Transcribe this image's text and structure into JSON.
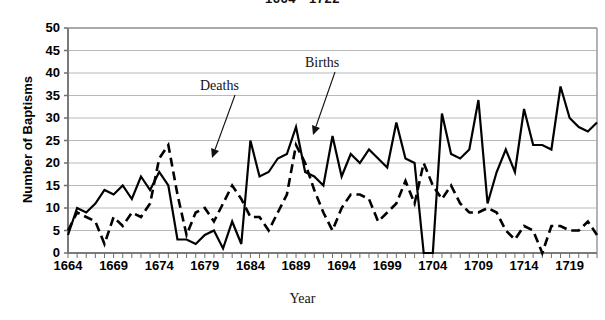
{
  "chart_data": {
    "type": "line",
    "title": "1664 - 1722",
    "xlabel": "Year",
    "ylabel": "Number of Baptisms",
    "xlim": [
      1664,
      1722
    ],
    "ylim": [
      0,
      50
    ],
    "ytick_step": 5,
    "xtick_step": 5,
    "grid": "horizontal",
    "legend_position": "inline-annotations",
    "x": [
      1664,
      1665,
      1666,
      1667,
      1668,
      1669,
      1670,
      1671,
      1672,
      1673,
      1674,
      1675,
      1676,
      1677,
      1678,
      1679,
      1680,
      1681,
      1682,
      1683,
      1684,
      1685,
      1686,
      1687,
      1688,
      1689,
      1690,
      1691,
      1692,
      1693,
      1694,
      1695,
      1696,
      1697,
      1698,
      1699,
      1700,
      1701,
      1702,
      1703,
      1704,
      1705,
      1706,
      1707,
      1708,
      1709,
      1710,
      1711,
      1712,
      1713,
      1714,
      1715,
      1716,
      1717,
      1718,
      1719,
      1720,
      1721,
      1722
    ],
    "xticks": [
      1664,
      1669,
      1674,
      1679,
      1684,
      1689,
      1694,
      1699,
      1704,
      1709,
      1714,
      1719
    ],
    "yticks": [
      0,
      5,
      10,
      15,
      20,
      25,
      30,
      35,
      40,
      45,
      50
    ],
    "series": [
      {
        "name": "Births",
        "style": "solid",
        "color": "#000000",
        "values": [
          4,
          10,
          9,
          11,
          14,
          13,
          15,
          12,
          17,
          14,
          18,
          15,
          3,
          3,
          2,
          4,
          5,
          1,
          7,
          2,
          25,
          17,
          18,
          21,
          22,
          28,
          18,
          17,
          15,
          26,
          17,
          22,
          20,
          23,
          21,
          19,
          29,
          21,
          20,
          0,
          0,
          31,
          22,
          21,
          23,
          34,
          11,
          18,
          23,
          18,
          32,
          24,
          24,
          23,
          37,
          30,
          28,
          27,
          29
        ]
      },
      {
        "name": "Deaths",
        "style": "dashed",
        "color": "#000000",
        "values": [
          5,
          9,
          8,
          7,
          2,
          8,
          6,
          9,
          8,
          11,
          21,
          24,
          13,
          4,
          9,
          10,
          7,
          11,
          15,
          12,
          8,
          8,
          5,
          9,
          13,
          24,
          20,
          14,
          9,
          5,
          10,
          13,
          13,
          12,
          7,
          9,
          11,
          16,
          11,
          20,
          15,
          12,
          15,
          11,
          9,
          9,
          10,
          9,
          5,
          3,
          6,
          5,
          0,
          6,
          6,
          5,
          5,
          7,
          4
        ]
      }
    ],
    "annotations": [
      {
        "text": "Deaths",
        "label_x": 200,
        "label_y": 78,
        "arrow_from_x": 235,
        "arrow_from_y": 95,
        "arrow_to_x": 212,
        "arrow_to_y": 158
      },
      {
        "text": "Births",
        "label_x": 305,
        "label_y": 55,
        "arrow_from_x": 335,
        "arrow_from_y": 72,
        "arrow_to_x": 313,
        "arrow_to_y": 135
      }
    ]
  },
  "axis": {
    "ytick_labels": [
      "50",
      "45",
      "40",
      "35",
      "30",
      "25",
      "20",
      "15",
      "10",
      "5",
      "0"
    ],
    "xtick_labels": [
      "1664",
      "1669",
      "1674",
      "1679",
      "1684",
      "1689",
      "1694",
      "1699",
      "1704",
      "1709",
      "1714",
      "1719"
    ],
    "y_title": "Number of Baptisms",
    "x_title": "Year"
  }
}
